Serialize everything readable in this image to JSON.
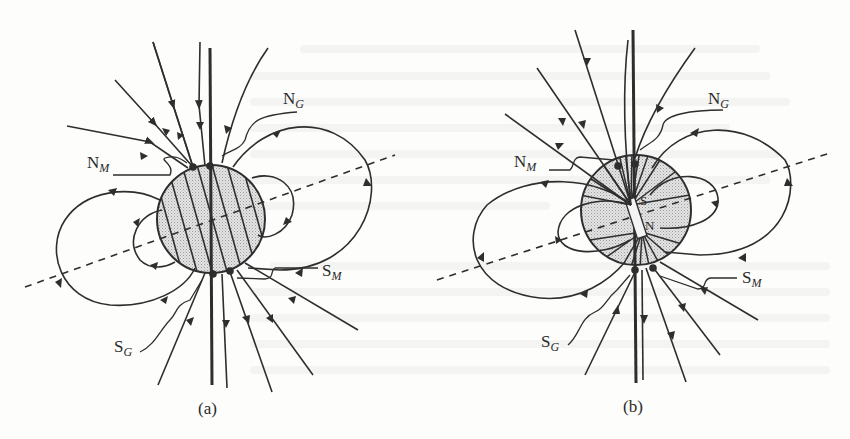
{
  "figure": {
    "stroke_color": "#2e2e2e",
    "fill_color": "#d9d9d9",
    "background_color": "#fdfdfc"
  },
  "panels": [
    {
      "id": "a",
      "caption": "(a)",
      "globe_style": "hatched",
      "labels": {
        "ng": {
          "main": "N",
          "sub": "G"
        },
        "nm": {
          "main": "N",
          "sub": "M"
        },
        "sm": {
          "main": "S",
          "sub": "M"
        },
        "sg": {
          "main": "S",
          "sub": "G"
        }
      }
    },
    {
      "id": "b",
      "caption": "(b)",
      "globe_style": "bar-magnet",
      "magnet": {
        "top_pole": "S",
        "bottom_pole": "N"
      },
      "labels": {
        "ng": {
          "main": "N",
          "sub": "G"
        },
        "nm": {
          "main": "N",
          "sub": "M"
        },
        "sm": {
          "main": "S",
          "sub": "M"
        },
        "sg": {
          "main": "S",
          "sub": "G"
        }
      }
    }
  ]
}
